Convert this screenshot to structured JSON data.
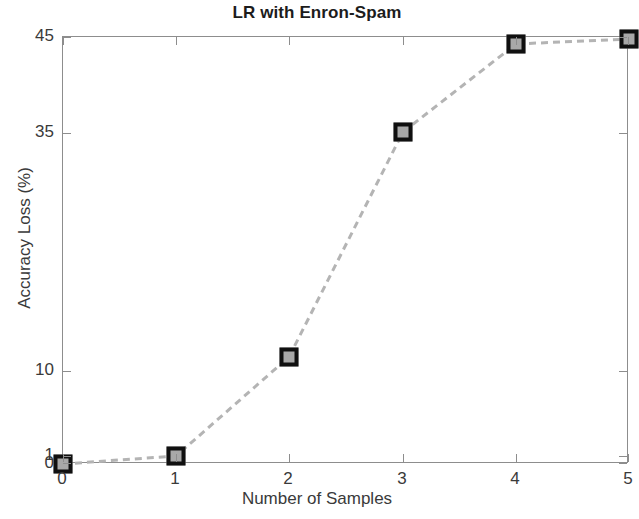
{
  "chart_data": {
    "type": "line",
    "title": "LR with Enron-Spam",
    "xlabel": "Number of Samples",
    "ylabel": "Accuracy Loss (%)",
    "x": [
      0,
      1,
      2,
      3,
      4,
      5
    ],
    "values": [
      0.3,
      1.0,
      10.5,
      35.0,
      44.0,
      44.6
    ],
    "series": [
      {
        "name": "Accuracy Loss",
        "x": [
          0,
          1,
          2,
          3,
          4,
          5
        ],
        "values": [
          0.3,
          1.0,
          10.5,
          35.0,
          44.0,
          44.6
        ]
      }
    ],
    "xticks": [
      "0",
      "1",
      "2",
      "3",
      "4",
      "5"
    ],
    "yticks": [
      "0",
      "1",
      "10",
      "35",
      "45"
    ],
    "xlim": [
      0,
      5
    ],
    "ylim": [
      0,
      45
    ],
    "grid": false,
    "legend": null,
    "line_style": "dashed",
    "line_color": "#b4b4b4",
    "marker_style": "square",
    "marker_face_color": "#a8a8a8",
    "marker_edge_color": "#101010",
    "axis_color": "#8d8d8d",
    "text_color": "#3a3a3a",
    "background": "#ffffff",
    "note": "Y axis uses non-uniform (stretched low-range) tick spacing; 0 and 1 labels nearly overlap at the baseline."
  },
  "tick_geometry": {
    "x_positions_px": [
      0,
      113,
      226,
      340,
      453,
      566
    ],
    "y_positions_px": [
      427,
      419,
      334,
      96,
      0
    ],
    "marker_points_px": [
      {
        "x": 0,
        "y": 427
      },
      {
        "x": 113,
        "y": 419
      },
      {
        "x": 226,
        "y": 320
      },
      {
        "x": 340,
        "y": 95
      },
      {
        "x": 453,
        "y": 7
      },
      {
        "x": 566,
        "y": 2
      }
    ]
  }
}
